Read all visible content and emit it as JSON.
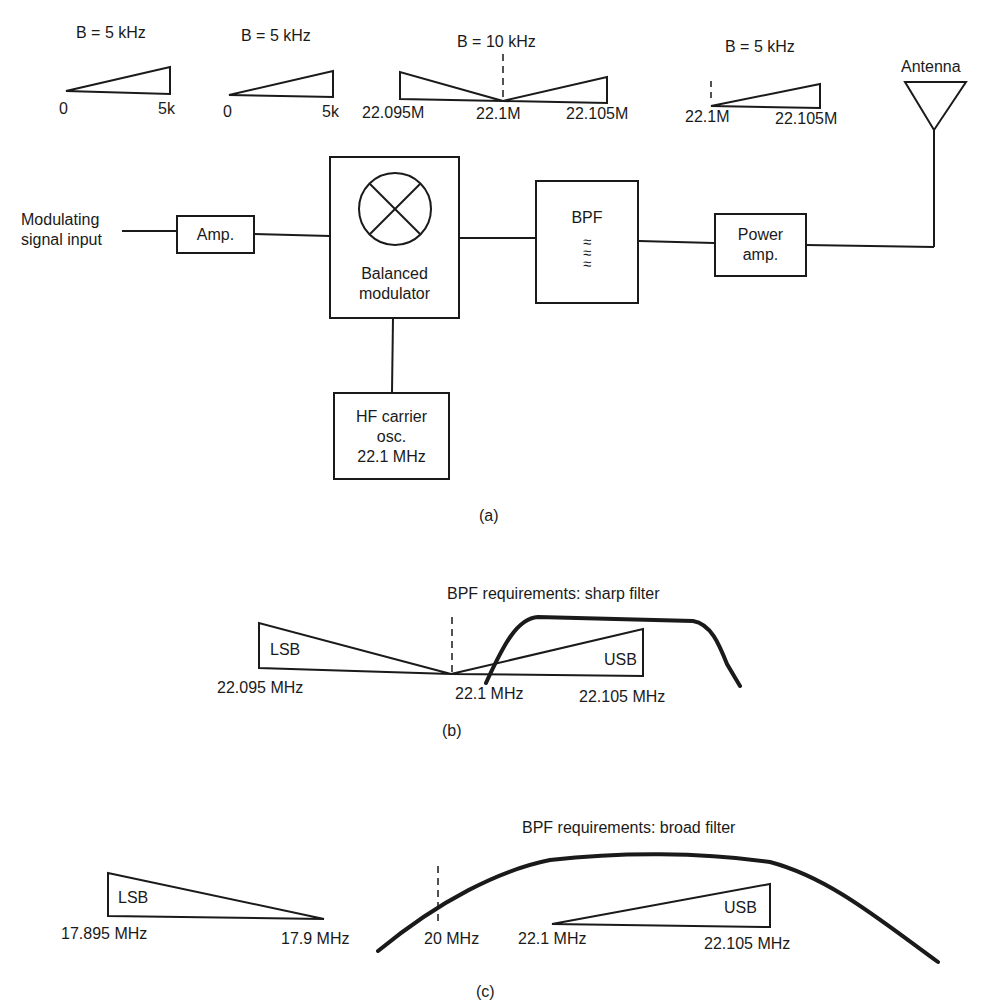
{
  "figure_a": {
    "caption": "(a)",
    "spectra": [
      {
        "bandwidth": "B = 5 kHz",
        "left": "0",
        "right": "5k"
      },
      {
        "bandwidth": "B = 5 kHz",
        "left": "0",
        "right": "5k"
      },
      {
        "bandwidth": "B = 10 kHz",
        "left": "22.095M",
        "center": "22.1M",
        "right": "22.105M"
      },
      {
        "bandwidth": "B = 5 kHz",
        "left": "22.1M",
        "right": "22.105M"
      }
    ],
    "input_label_line1": "Modulating",
    "input_label_line2": "signal input",
    "blocks": {
      "amp": "Amp.",
      "balanced_modulator_line1": "Balanced",
      "balanced_modulator_line2": "modulator",
      "bpf": "BPF",
      "bpf_symbol": "≈",
      "power_amp_line1": "Power",
      "power_amp_line2": "amp.",
      "oscillator_line1": "HF carrier",
      "oscillator_line2": "osc.",
      "oscillator_line3": "22.1 MHz"
    },
    "antenna_label": "Antenna"
  },
  "figure_b": {
    "caption": "(b)",
    "title": "BPF requirements:  sharp filter",
    "lsb_label": "LSB",
    "usb_label": "USB",
    "freq_left": "22.095 MHz",
    "freq_center": "22.1 MHz",
    "freq_right": "22.105 MHz"
  },
  "figure_c": {
    "caption": "(c)",
    "title": "BPF requirements:  broad filter",
    "lsb_label": "LSB",
    "usb_label": "USB",
    "lsb_left": "17.895 MHz",
    "lsb_right": "17.9 MHz",
    "center": "20 MHz",
    "usb_left": "22.1 MHz",
    "usb_right": "22.105 MHz"
  }
}
